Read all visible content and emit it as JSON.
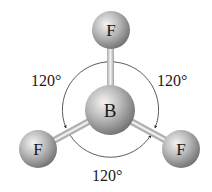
{
  "diagram": {
    "central_atom": {
      "symbol": "B"
    },
    "outer_atoms": [
      {
        "symbol": "F",
        "position": "top"
      },
      {
        "symbol": "F",
        "position": "bottom-left"
      },
      {
        "symbol": "F",
        "position": "bottom-right"
      }
    ],
    "angles": [
      {
        "label": "120°",
        "position": "upper-left"
      },
      {
        "label": "120°",
        "position": "upper-right"
      },
      {
        "label": "120°",
        "position": "bottom"
      }
    ],
    "colors": {
      "atom_light": "#e6e6e6",
      "atom_dark": "#7a7a7a",
      "bond": "#d8d8d8",
      "arc": "#333333"
    }
  }
}
